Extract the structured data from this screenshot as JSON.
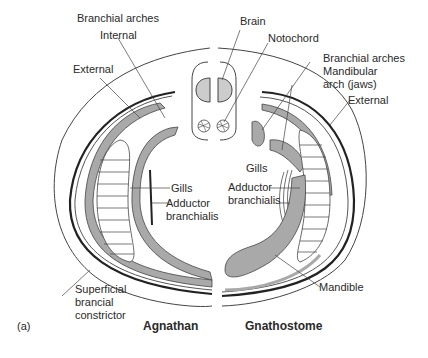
{
  "figure": {
    "panel_label": "(a)",
    "left_title": "Agnathan",
    "right_title": "Gnathostome",
    "left_labels": {
      "branchial_arches": "Branchial arches",
      "internal": "Internal",
      "external": "External",
      "gills": "Gills",
      "adductor_1": "Adductor",
      "adductor_2": "branchialis",
      "superficial_1": "Superficial",
      "superficial_2": "brancial",
      "superficial_3": "constrictor"
    },
    "right_labels": {
      "brain": "Brain",
      "notochord": "Notochord",
      "branchial_arches": "Branchial arches",
      "mandibular_1": "Mandibular",
      "mandibular_2": "arch (jaws)",
      "external": "External",
      "gills": "Gills",
      "adductor_1": "Adductor",
      "adductor_2": "branchialis",
      "mandible": "Mandible"
    },
    "colors": {
      "cartilage_fill": "#a9a9a9",
      "brain_fill": "#cccccc",
      "line": "#333333",
      "text": "#2a2a2a"
    }
  }
}
